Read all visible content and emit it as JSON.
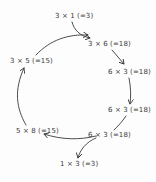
{
  "diagram": {
    "nodes": [
      {
        "id": "n1",
        "label": "3 × 1 (=3)"
      },
      {
        "id": "n2",
        "label": "3 × 6 (=18)"
      },
      {
        "id": "n3",
        "label": "6 × 3 (=18)"
      },
      {
        "id": "n4",
        "label": "6 × 3 (=18)"
      },
      {
        "id": "n5",
        "label": "6 × 3 (=18)"
      },
      {
        "id": "n6",
        "label": "1 × 3 (=3)"
      },
      {
        "id": "n7",
        "label": "5 × 8 (=15)"
      },
      {
        "id": "n8",
        "label": "3 × 5 (=15)"
      }
    ],
    "edges": [
      {
        "from": "n1",
        "to": "n2"
      },
      {
        "from": "n2",
        "to": "n3"
      },
      {
        "from": "n3",
        "to": "n4"
      },
      {
        "from": "n4",
        "to": "n5"
      },
      {
        "from": "n5",
        "to": "n6"
      },
      {
        "from": "n5",
        "to": "n7"
      },
      {
        "from": "n7",
        "to": "n8"
      },
      {
        "from": "n8",
        "to": "n2"
      }
    ],
    "colors": {
      "ink": "#3a3a3a",
      "background": "#fdfdfd"
    }
  }
}
